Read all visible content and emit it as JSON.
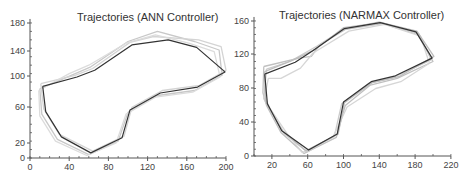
{
  "chart_data": [
    {
      "type": "line",
      "title": "Trajectories (ANN Controller)",
      "xlabel": "",
      "ylabel": "",
      "xlim": [
        0,
        200
      ],
      "ylim": [
        0,
        160
      ],
      "xticks": [
        0,
        40,
        80,
        120,
        160,
        200
      ],
      "yticks": [
        0,
        20,
        60,
        100,
        140,
        180
      ],
      "ytick_labels": [
        "0",
        "20",
        "60",
        "100",
        "140",
        "180"
      ],
      "grid": false,
      "legend": null,
      "series": [
        {
          "name": "reference / main trajectory",
          "color": "#333333",
          "points": [
            [
              13,
              85
            ],
            [
              16,
              55
            ],
            [
              32,
              25
            ],
            [
              62,
              6
            ],
            [
              94,
              24
            ],
            [
              102,
              57
            ],
            [
              133,
              77
            ],
            [
              171,
              84
            ],
            [
              199,
              102
            ],
            [
              170,
              131
            ],
            [
              141,
              140
            ],
            [
              104,
              134
            ],
            [
              66,
              104
            ],
            [
              48,
              96
            ],
            [
              13,
              85
            ]
          ]
        },
        {
          "name": "run 2",
          "color": "#c8c8c8",
          "points": [
            [
              10,
              82
            ],
            [
              12,
              52
            ],
            [
              28,
              22
            ],
            [
              60,
              4
            ],
            [
              90,
              20
            ],
            [
              100,
              54
            ],
            [
              130,
              74
            ],
            [
              168,
              80
            ],
            [
              196,
              98
            ],
            [
              193,
              128
            ],
            [
              168,
              138
            ],
            [
              130,
              150
            ],
            [
              100,
              138
            ],
            [
              62,
              108
            ],
            [
              42,
              98
            ],
            [
              10,
              82
            ]
          ]
        },
        {
          "name": "run 3",
          "color": "#d4d4d4",
          "points": [
            [
              11,
              88
            ],
            [
              14,
              58
            ],
            [
              30,
              28
            ],
            [
              64,
              8
            ],
            [
              96,
              26
            ],
            [
              104,
              60
            ],
            [
              135,
              80
            ],
            [
              173,
              86
            ],
            [
              200,
              104
            ],
            [
              195,
              132
            ],
            [
              172,
              140
            ],
            [
              126,
              144
            ],
            [
              102,
              137
            ],
            [
              64,
              106
            ],
            [
              46,
              98
            ],
            [
              11,
              88
            ]
          ]
        },
        {
          "name": "run 4",
          "color": "#dcdcdc",
          "points": [
            [
              9,
              80
            ],
            [
              10,
              50
            ],
            [
              26,
              20
            ],
            [
              58,
              3
            ],
            [
              88,
              18
            ],
            [
              98,
              52
            ],
            [
              128,
              72
            ],
            [
              166,
              78
            ],
            [
              194,
              96
            ],
            [
              188,
              126
            ],
            [
              162,
              136
            ],
            [
              128,
              146
            ],
            [
              98,
              136
            ],
            [
              60,
              110
            ],
            [
              40,
              100
            ],
            [
              9,
              80
            ]
          ]
        }
      ]
    },
    {
      "type": "line",
      "title": "Trajectories (NARMAX Controller)",
      "xlabel": "",
      "ylabel": "",
      "xlim": [
        0,
        220
      ],
      "ylim": [
        0,
        160
      ],
      "xticks": [
        20,
        60,
        100,
        140,
        180,
        220
      ],
      "yticks": [
        0,
        40,
        80,
        120,
        160
      ],
      "ytick_labels": [
        "0",
        "40",
        "80",
        "120",
        "160"
      ],
      "grid": false,
      "legend": null,
      "series": [
        {
          "name": "reference / main trajectory",
          "color": "#333333",
          "points": [
            [
              12,
              97
            ],
            [
              15,
              62
            ],
            [
              31,
              30
            ],
            [
              61,
              7
            ],
            [
              93,
              26
            ],
            [
              100,
              64
            ],
            [
              131,
              88
            ],
            [
              158,
              95
            ],
            [
              199,
              116
            ],
            [
              181,
              147
            ],
            [
              141,
              158
            ],
            [
              101,
              151
            ],
            [
              66,
              125
            ],
            [
              46,
              111
            ],
            [
              12,
              97
            ]
          ]
        },
        {
          "name": "run 2",
          "color": "#c0c0c0",
          "points": [
            [
              11,
              106
            ],
            [
              10,
              75
            ],
            [
              14,
              60
            ],
            [
              30,
              28
            ],
            [
              56,
              3
            ],
            [
              92,
              22
            ],
            [
              102,
              60
            ],
            [
              130,
              84
            ],
            [
              160,
              92
            ],
            [
              200,
              112
            ],
            [
              183,
              144
            ],
            [
              143,
              157
            ],
            [
              102,
              150
            ],
            [
              74,
              132
            ],
            [
              64,
              118
            ],
            [
              50,
              116
            ],
            [
              11,
              106
            ]
          ]
        },
        {
          "name": "run 3",
          "color": "#cccccc",
          "points": [
            [
              14,
              103
            ],
            [
              11,
              68
            ],
            [
              16,
              58
            ],
            [
              34,
              26
            ],
            [
              60,
              5
            ],
            [
              90,
              24
            ],
            [
              98,
              62
            ],
            [
              128,
              86
            ],
            [
              156,
              93
            ],
            [
              198,
              114
            ],
            [
              184,
              145
            ],
            [
              140,
              159
            ],
            [
              100,
              150
            ],
            [
              70,
              130
            ],
            [
              40,
              112
            ],
            [
              14,
              103
            ]
          ]
        },
        {
          "name": "run 4",
          "color": "#d6d6d6",
          "points": [
            [
              16,
              92
            ],
            [
              12,
              70
            ],
            [
              18,
              56
            ],
            [
              36,
              28
            ],
            [
              54,
              4
            ],
            [
              88,
              22
            ],
            [
              104,
              58
            ],
            [
              136,
              80
            ],
            [
              164,
              88
            ],
            [
              196,
              110
            ],
            [
              186,
              142
            ],
            [
              146,
              156
            ],
            [
              106,
              148
            ],
            [
              66,
              122
            ],
            [
              52,
              104
            ],
            [
              30,
              92
            ],
            [
              16,
              92
            ]
          ]
        },
        {
          "name": "run 5",
          "color": "#bdbdbd",
          "points": [
            [
              12,
              100
            ],
            [
              13,
              66
            ],
            [
              15,
              60
            ],
            [
              32,
              30
            ],
            [
              58,
              6
            ],
            [
              94,
              26
            ],
            [
              101,
              63
            ],
            [
              132,
              87
            ],
            [
              162,
              94
            ],
            [
              201,
              118
            ],
            [
              182,
              148
            ],
            [
              142,
              158
            ],
            [
              100,
              152
            ],
            [
              68,
              126
            ],
            [
              44,
              114
            ],
            [
              12,
              100
            ]
          ]
        }
      ]
    }
  ]
}
